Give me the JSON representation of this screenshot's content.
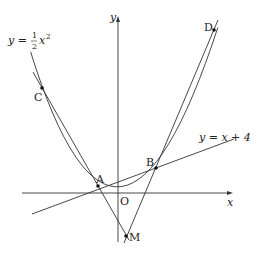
{
  "diagram": {
    "axes": {
      "x_label": "x",
      "y_label": "y",
      "origin_label": "O"
    },
    "curves": {
      "parabola_label_lhs": "y = ",
      "parabola_frac_num": "1",
      "parabola_frac_den": "2",
      "parabola_label_rhs": "x",
      "parabola_exp": "2",
      "line_label": "y = x + 4"
    },
    "points": [
      {
        "name": "A",
        "label": "A"
      },
      {
        "name": "B",
        "label": "B"
      },
      {
        "name": "C",
        "label": "C"
      },
      {
        "name": "D",
        "label": "D"
      },
      {
        "name": "M",
        "label": "M"
      }
    ],
    "colors": {
      "stroke": "#333333",
      "text": "#222222",
      "background": "#ffffff"
    }
  }
}
